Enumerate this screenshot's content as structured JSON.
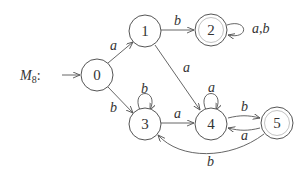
{
  "diagram": {
    "title": "M",
    "title_subscript": "8",
    "title_suffix": ":",
    "type": "DFA",
    "start_state": "0",
    "states": [
      {
        "id": "0",
        "label": "0",
        "accepting": false
      },
      {
        "id": "1",
        "label": "1",
        "accepting": false
      },
      {
        "id": "2",
        "label": "2",
        "accepting": true
      },
      {
        "id": "3",
        "label": "3",
        "accepting": false
      },
      {
        "id": "4",
        "label": "4",
        "accepting": false
      },
      {
        "id": "5",
        "label": "5",
        "accepting": true
      }
    ],
    "transitions": [
      {
        "from": "0",
        "to": "1",
        "label": "a"
      },
      {
        "from": "0",
        "to": "3",
        "label": "b"
      },
      {
        "from": "1",
        "to": "2",
        "label": "b"
      },
      {
        "from": "1",
        "to": "4",
        "label": "a"
      },
      {
        "from": "2",
        "to": "2",
        "label": "a,b"
      },
      {
        "from": "3",
        "to": "3",
        "label": "b"
      },
      {
        "from": "3",
        "to": "4",
        "label": "a"
      },
      {
        "from": "4",
        "to": "4",
        "label": "a"
      },
      {
        "from": "4",
        "to": "5",
        "label": "b"
      },
      {
        "from": "5",
        "to": "4",
        "label": "a"
      },
      {
        "from": "5",
        "to": "3",
        "label": "b"
      }
    ]
  }
}
